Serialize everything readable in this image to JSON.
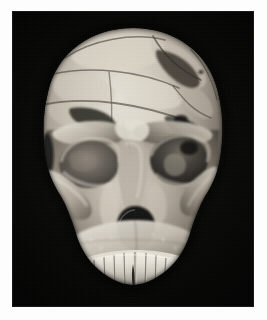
{
  "page": {
    "background_color": "#fdfdfd",
    "width": 267,
    "height": 320
  },
  "photo": {
    "type": "photograph",
    "medium": "black-and-white photograph",
    "background_color": "#050505",
    "frame": {
      "x": 13,
      "y": 12,
      "width": 240,
      "height": 294
    },
    "subject": "human skull",
    "view": "anterior (frontal) view",
    "description": "Reconstructed fossil hominin cranium photographed frontally against a plain black background, showing glued-together bone fragments, reconstruction fracture lines, gaps of missing bone, prominent supraorbital brow ridges, both orbits, the piriform (nasal) aperture and a row of upper teeth.",
    "tone": "grayscale",
    "lighting": "directional light from upper left"
  },
  "anatomy": {
    "regions": [
      {
        "id": "cranial-vault",
        "label": "Cranial vault (frontal and parietal bones)"
      },
      {
        "id": "coronal-suture-line",
        "label": "Reconstruction fracture line across vault"
      },
      {
        "id": "brow-ridge-left",
        "label": "Left supraorbital brow ridge"
      },
      {
        "id": "brow-ridge-right",
        "label": "Right supraorbital brow ridge"
      },
      {
        "id": "orbit-left",
        "label": "Left eye orbit"
      },
      {
        "id": "orbit-right",
        "label": "Right eye orbit"
      },
      {
        "id": "nasal-bridge",
        "label": "Nasal bridge / interorbital region"
      },
      {
        "id": "nasal-aperture",
        "label": "Piriform nasal aperture"
      },
      {
        "id": "zygomatic-left",
        "label": "Left zygomatic (cheek) bone"
      },
      {
        "id": "zygomatic-right",
        "label": "Right zygomatic (cheek) bone"
      },
      {
        "id": "maxilla",
        "label": "Maxilla (upper jaw)"
      },
      {
        "id": "dentition",
        "label": "Upper dentition (tooth row)"
      },
      {
        "id": "missing-fragments",
        "label": "Areas of missing bone (dark voids)"
      }
    ],
    "teeth_count": 12
  },
  "colors": {
    "page_background": "#fdfdfd",
    "photo_background": "#050505",
    "bone_highlight": "#f2efe8",
    "bone_midtone": "#b4ada2",
    "bone_shadow": "#6e675d",
    "deep_shadow": "#201d1a",
    "void_black": "#0a0a0a"
  }
}
